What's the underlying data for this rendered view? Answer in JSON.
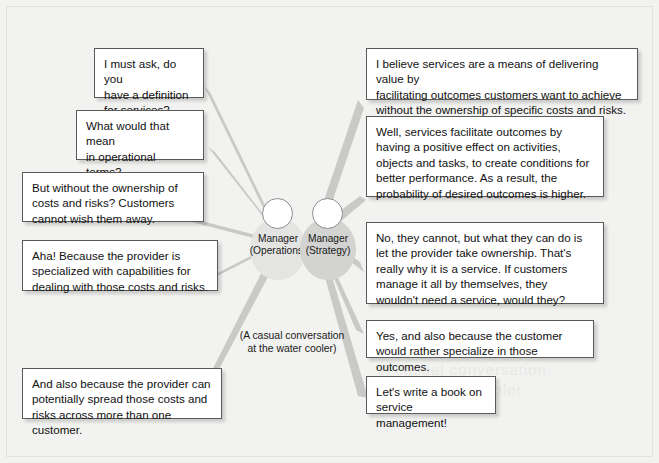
{
  "diagram": {
    "title": "A casual conversation at the water cooler",
    "background_color": "#f2f2f0",
    "bubble_border_color": "#5a5a5a",
    "bubble_fill_color": "#ffffff",
    "ray_color": "#c9c9c7",
    "caption": "(A casual conversation\nat the water cooler)",
    "ghost_watermark": "A casual conversation\nat the water cooler"
  },
  "figures": [
    {
      "id": "manager-operations",
      "role": "Manager",
      "department": "(Operations)",
      "label": "Manager\n(Operations)",
      "blob_color": "#e4e4e2"
    },
    {
      "id": "manager-strategy",
      "role": "Manager",
      "department": "(Strategy)",
      "label": "Manager\n(Strategy)",
      "blob_color": "#d3d3d1"
    }
  ],
  "bubbles": [
    {
      "id": "ops-1",
      "speaker": "manager-operations",
      "side": "left",
      "order": 1,
      "text": "I must ask, do you\nhave a definition\nfor services?"
    },
    {
      "id": "ops-2",
      "speaker": "manager-operations",
      "side": "left",
      "order": 2,
      "text": "What would that mean\nin operational terms?\nGive me a few handles."
    },
    {
      "id": "ops-3",
      "speaker": "manager-operations",
      "side": "left",
      "order": 3,
      "text": "But without the ownership of\ncosts and risks? Customers\ncannot wish them away."
    },
    {
      "id": "ops-4",
      "speaker": "manager-operations",
      "side": "left",
      "order": 4,
      "text": "Aha! Because the provider is\nspecialized with capabilities for\ndealing with those costs and risks."
    },
    {
      "id": "ops-5",
      "speaker": "manager-operations",
      "side": "left",
      "order": 5,
      "text": "And also because the provider can\npotentially spread those costs and\nrisks across more than one customer."
    },
    {
      "id": "str-1",
      "speaker": "manager-strategy",
      "side": "right",
      "order": 1,
      "text": "I believe services are a means of delivering value by\nfacilitating outcomes customers want to achieve\nwithout the ownership of specific costs and risks."
    },
    {
      "id": "str-2",
      "speaker": "manager-strategy",
      "side": "right",
      "order": 2,
      "text": "Well, services facilitate outcomes by\nhaving a positive effect on activities,\nobjects and tasks, to create conditions for\nbetter performance. As a result, the\nprobability of desired outcomes is higher."
    },
    {
      "id": "str-3",
      "speaker": "manager-strategy",
      "side": "right",
      "order": 3,
      "text": "No, they cannot, but what they can do is\nlet the provider take ownership. That's\nreally why it is a service. If customers\nmanage it all by themselves, they\nwouldn't need a service, would they?"
    },
    {
      "id": "str-4",
      "speaker": "manager-strategy",
      "side": "right",
      "order": 4,
      "text": "Yes, and also because the customer\nwould rather specialize in those outcomes."
    },
    {
      "id": "str-5",
      "speaker": "manager-strategy",
      "side": "right",
      "order": 5,
      "text": "Let's write a book on\nservice management!"
    }
  ]
}
